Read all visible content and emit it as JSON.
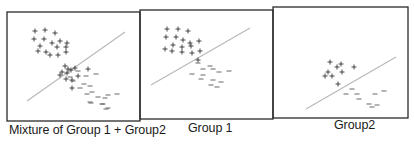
{
  "figure": {
    "panels": [
      {
        "id": "mixture",
        "label": "Mixture of Group 1 + Group2",
        "frame": {
          "x": 7,
          "y": 12,
          "w": 133,
          "h": 109
        },
        "line": {
          "x1": 27,
          "y1": 101,
          "x2": 125,
          "y2": 32
        },
        "plus": [
          [
            35,
            31
          ],
          [
            45,
            30
          ],
          [
            55,
            33
          ],
          [
            34,
            39
          ],
          [
            44,
            39
          ],
          [
            52,
            43
          ],
          [
            60,
            41
          ],
          [
            67,
            43
          ],
          [
            40,
            46
          ],
          [
            57,
            47
          ],
          [
            66,
            47
          ],
          [
            38,
            51
          ],
          [
            46,
            52
          ],
          [
            50,
            55
          ],
          [
            58,
            55
          ],
          [
            66,
            52
          ],
          [
            65,
            66
          ],
          [
            68,
            69
          ],
          [
            62,
            72
          ],
          [
            71,
            70
          ],
          [
            75,
            68
          ],
          [
            67,
            73
          ],
          [
            88,
            69
          ],
          [
            60,
            75
          ],
          [
            66,
            79
          ],
          [
            72,
            80
          ],
          [
            78,
            76
          ],
          [
            72,
            88
          ]
        ],
        "minus": [
          [
            78,
            71
          ],
          [
            96,
            74
          ],
          [
            70,
            77
          ],
          [
            86,
            76
          ],
          [
            73,
            81
          ],
          [
            84,
            84
          ],
          [
            80,
            88
          ],
          [
            90,
            86
          ],
          [
            92,
            92
          ],
          [
            87,
            94
          ],
          [
            98,
            97
          ],
          [
            91,
            103
          ],
          [
            108,
            95
          ],
          [
            117,
            94
          ],
          [
            105,
            98
          ],
          [
            90,
            102
          ],
          [
            103,
            104
          ],
          [
            108,
            108
          ],
          [
            102,
            104
          ],
          [
            106,
            109
          ]
        ]
      },
      {
        "id": "group1",
        "label": "Group 1",
        "frame": {
          "x": 140,
          "y": 10,
          "w": 133,
          "h": 109
        },
        "line": {
          "x1": 151,
          "y1": 85,
          "x2": 250,
          "y2": 28
        },
        "plus": [
          [
            167,
            29
          ],
          [
            178,
            29
          ],
          [
            188,
            31
          ],
          [
            166,
            37
          ],
          [
            176,
            37
          ],
          [
            183,
            40
          ],
          [
            190,
            43
          ],
          [
            199,
            41
          ],
          [
            173,
            45
          ],
          [
            182,
            47
          ],
          [
            191,
            46
          ],
          [
            165,
            49
          ],
          [
            172,
            51
          ],
          [
            182,
            52
          ],
          [
            192,
            53
          ],
          [
            200,
            51
          ],
          [
            198,
            60
          ]
        ],
        "minus": [
          [
            198,
            63
          ],
          [
            210,
            66
          ],
          [
            203,
            69
          ],
          [
            213,
            69
          ],
          [
            192,
            74
          ],
          [
            203,
            75
          ],
          [
            219,
            72
          ],
          [
            229,
            71
          ],
          [
            201,
            79
          ],
          [
            213,
            80
          ],
          [
            211,
            85
          ],
          [
            221,
            82
          ],
          [
            217,
            87
          ]
        ]
      },
      {
        "id": "group2",
        "label": "Group2",
        "frame": {
          "x": 273,
          "y": 7,
          "w": 135,
          "h": 111
        },
        "line": {
          "x1": 306,
          "y1": 109,
          "x2": 396,
          "y2": 57
        },
        "plus": [
          [
            330,
            62
          ],
          [
            337,
            67
          ],
          [
            341,
            64
          ],
          [
            354,
            67
          ],
          [
            328,
            72
          ],
          [
            332,
            76
          ],
          [
            342,
            72
          ],
          [
            325,
            76
          ],
          [
            338,
            84
          ]
        ],
        "minus": [
          [
            352,
            89
          ],
          [
            346,
            94
          ],
          [
            357,
            94
          ],
          [
            375,
            94
          ],
          [
            384,
            91
          ],
          [
            359,
            99
          ],
          [
            369,
            104
          ],
          [
            377,
            105
          ],
          [
            372,
            107
          ]
        ]
      }
    ]
  }
}
